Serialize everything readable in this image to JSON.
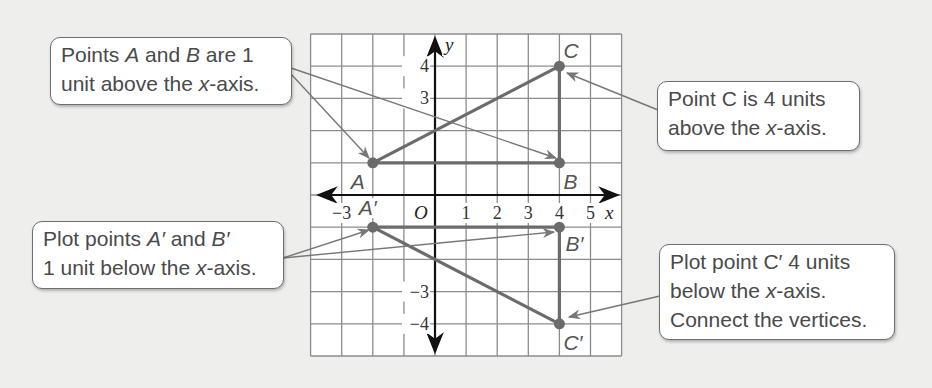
{
  "callouts": {
    "ab": {
      "line1_pre": "Points ",
      "line1_a": "A",
      "line1_mid": " and ",
      "line1_b": "B",
      "line1_post": " are 1",
      "line2_pre": "unit above the ",
      "line2_x": "x",
      "line2_post": "-axis."
    },
    "c": {
      "line1": "Point C is 4 units",
      "line2_pre": "above the ",
      "line2_x": "x",
      "line2_post": "-axis."
    },
    "ab_prime": {
      "line1_pre": "Plot points ",
      "line1_a": "A′",
      "line1_mid": " and ",
      "line1_b": "B′",
      "line2_pre": "1 unit below the ",
      "line2_x": "x",
      "line2_post": "-axis."
    },
    "c_prime": {
      "line1": "Plot point C′ 4 units",
      "line2_pre": "below the ",
      "line2_x": "x",
      "line2_post": "-axis.",
      "line3": "Connect the vertices."
    }
  },
  "graph": {
    "x_axis_label": "x",
    "y_axis_label": "y",
    "origin_label": "O",
    "x_ticks": [
      {
        "value": -3,
        "label": "−3"
      },
      {
        "value": 1,
        "label": "1"
      },
      {
        "value": 2,
        "label": "2"
      },
      {
        "value": 3,
        "label": "3"
      },
      {
        "value": 4,
        "label": "4"
      },
      {
        "value": 5,
        "label": "5"
      }
    ],
    "y_ticks": [
      {
        "value": 4,
        "label": "4"
      },
      {
        "value": 3,
        "label": "3"
      },
      {
        "value": -3,
        "label": "−3"
      },
      {
        "value": -4,
        "label": "−4"
      }
    ],
    "x_range": [
      -4,
      6
    ],
    "y_range": [
      -5,
      5
    ],
    "points": [
      {
        "name": "A",
        "label": "A",
        "x": -2,
        "y": 1
      },
      {
        "name": "B",
        "label": "B",
        "x": 4,
        "y": 1
      },
      {
        "name": "C",
        "label": "C",
        "x": 4,
        "y": 4
      },
      {
        "name": "A-prime",
        "label": "A′",
        "x": -2,
        "y": -1
      },
      {
        "name": "B-prime",
        "label": "B′",
        "x": 4,
        "y": -1
      },
      {
        "name": "C-prime",
        "label": "C′",
        "x": 4,
        "y": -4
      }
    ],
    "colors": {
      "triangle": "#6b6b6b",
      "grid": "#8c8c8c",
      "axis": "#1a1a1a",
      "background": "#eeeeec"
    }
  }
}
